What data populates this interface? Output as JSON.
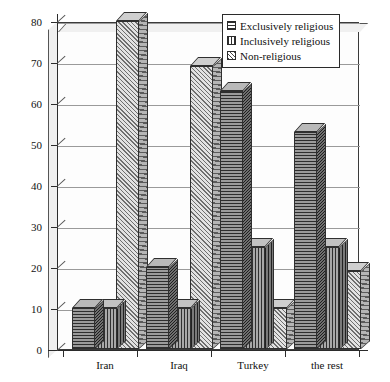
{
  "chart_data": {
    "type": "bar",
    "title": "",
    "xlabel": "",
    "ylabel": "",
    "ylim": [
      0,
      80
    ],
    "grid": true,
    "legend_position": "top-right",
    "style": "3d-bar-grouped",
    "categories": [
      "Iran",
      "Iraq",
      "Turkey",
      "the rest"
    ],
    "yticks": [
      0,
      10,
      20,
      30,
      40,
      50,
      60,
      70,
      80
    ],
    "series": [
      {
        "name": "Exclusively religious",
        "pattern": "horizontal-hatch",
        "values": [
          10,
          20,
          63,
          53
        ]
      },
      {
        "name": "Inclusively religious",
        "pattern": "vertical-hatch",
        "values": [
          10,
          10,
          25,
          25
        ]
      },
      {
        "name": "Non-religious",
        "pattern": "diagonal-hatch",
        "values": [
          80,
          69,
          10,
          19
        ]
      }
    ]
  },
  "legend": {
    "items": [
      {
        "label": "Exclusively religious"
      },
      {
        "label": "Inclusively religious"
      },
      {
        "label": "Non-religious"
      }
    ]
  }
}
